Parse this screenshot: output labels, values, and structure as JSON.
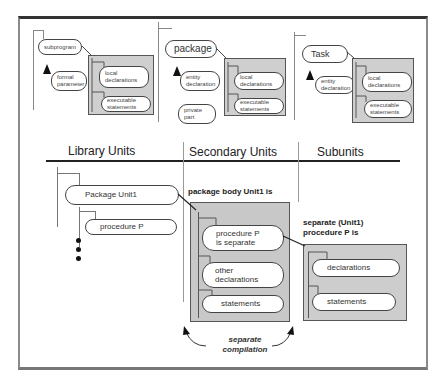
{
  "top_row": {
    "subprogram": {
      "title": "subprogram",
      "param": "formal\nparameter",
      "body_items": [
        "local\ndeclarations",
        "executable\nstatements"
      ]
    },
    "package": {
      "title": "package",
      "entry": "entity\ndeclaration",
      "private": "private\npart",
      "body_items": [
        "local\ndeclarations",
        "executable\nstatements"
      ]
    },
    "task": {
      "title": "Task",
      "entry": "entity\ndeclaration",
      "body_items": [
        "local\ndeclarations",
        "executable\nstatements"
      ]
    }
  },
  "columns": {
    "library_units": "Library Units",
    "secondary_units": "Secondary Units",
    "subunits": "Subunits"
  },
  "library": {
    "package_unit": "Package Unit1",
    "procedure": "procedure P"
  },
  "secondary": {
    "header": "package body Unit1 is",
    "items": [
      "procedure P\nis separate",
      "other\ndeclarations",
      "statements"
    ]
  },
  "subunit": {
    "header": "separate (Unit1)\nprocedure P is",
    "items": [
      "declarations",
      "statements"
    ]
  },
  "annotation": "separate\ncompilation"
}
